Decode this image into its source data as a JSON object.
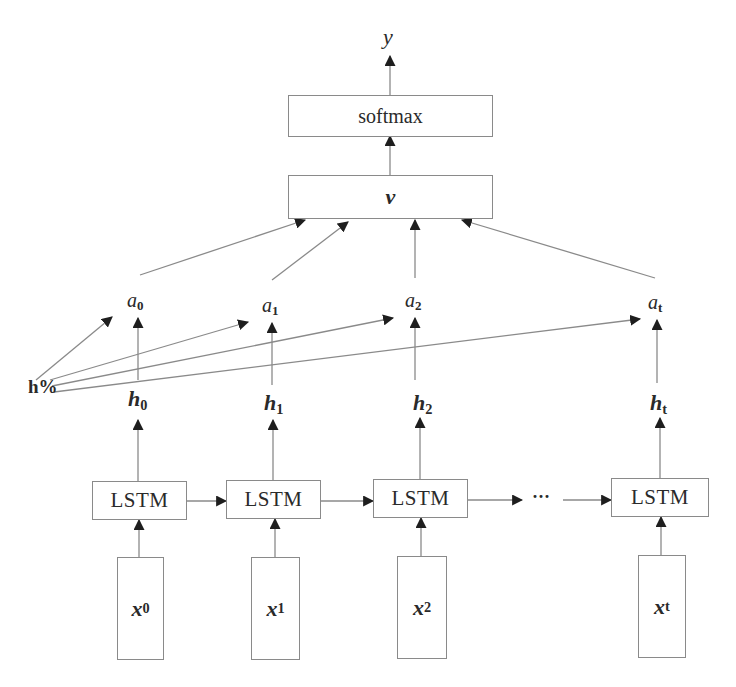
{
  "diagram": {
    "type": "LSTM with attention",
    "output": {
      "label": "y"
    },
    "softmax": {
      "label": "softmax"
    },
    "context": {
      "label": "v"
    },
    "attention": [
      {
        "base": "a",
        "sub": "0"
      },
      {
        "base": "a",
        "sub": "1"
      },
      {
        "base": "a",
        "sub": "2"
      },
      {
        "base": "a",
        "sub": "t"
      }
    ],
    "query": {
      "label": "h%"
    },
    "hidden": [
      {
        "base": "h",
        "sub": "0"
      },
      {
        "base": "h",
        "sub": "1"
      },
      {
        "base": "h",
        "sub": "2"
      },
      {
        "base": "h",
        "sub": "t"
      }
    ],
    "cells": [
      {
        "label": "LSTM"
      },
      {
        "label": "LSTM"
      },
      {
        "label": "LSTM"
      },
      {
        "label": "LSTM"
      }
    ],
    "ellipsis": "···",
    "inputs": [
      {
        "base": "x",
        "sub": "0"
      },
      {
        "base": "x",
        "sub": "1"
      },
      {
        "base": "x",
        "sub": "2"
      },
      {
        "base": "x",
        "sub": "t"
      }
    ],
    "line_color": "#8a8a8a",
    "arrow_color": "#1e1e1e"
  }
}
